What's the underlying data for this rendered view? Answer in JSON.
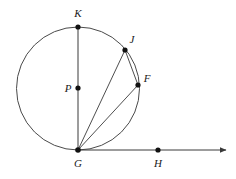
{
  "figure": {
    "kind": "circle-geometry-diagram",
    "background_color": "#ffffff",
    "stroke_color": "#3a3a3a",
    "point_color": "#111111",
    "label_color": "#1a1a1a",
    "width": 236,
    "height": 179
  },
  "circle": {
    "name": "circle-P",
    "center_label": "P",
    "center_x": 78,
    "center_y": 88.5,
    "radius": 61.5
  },
  "points": [
    {
      "id": "K",
      "label": "K",
      "x": 78,
      "y": 27,
      "label_x": 78,
      "label_y": 17,
      "on_circle": true,
      "position": "top"
    },
    {
      "id": "J",
      "label": "J",
      "x": 125,
      "y": 50,
      "label_x": 132,
      "label_y": 43,
      "on_circle": true,
      "position": "upper-right"
    },
    {
      "id": "F",
      "label": "F",
      "x": 138,
      "y": 85,
      "label_x": 147,
      "label_y": 82,
      "on_circle": true,
      "position": "right"
    },
    {
      "id": "P",
      "label": "P",
      "x": 78,
      "y": 88,
      "label_x": 68,
      "label_y": 91,
      "on_circle": false,
      "position": "center"
    },
    {
      "id": "G",
      "label": "G",
      "x": 78,
      "y": 150,
      "label_x": 78,
      "label_y": 166,
      "on_circle": true,
      "position": "bottom"
    },
    {
      "id": "H",
      "label": "H",
      "x": 158,
      "y": 150,
      "label_x": 158,
      "label_y": 166,
      "on_circle": false,
      "position": "bottom-right-on-ray"
    }
  ],
  "segments": [
    {
      "id": "KG",
      "name": "diameter-k-g",
      "from": "K",
      "to": "G",
      "x1": 78,
      "y1": 27,
      "x2": 78,
      "y2": 150
    },
    {
      "id": "GJ",
      "name": "chord-g-j",
      "from": "G",
      "to": "J",
      "x1": 78,
      "y1": 150,
      "x2": 125,
      "y2": 50
    },
    {
      "id": "GF",
      "name": "chord-g-f",
      "from": "G",
      "to": "F",
      "x1": 78,
      "y1": 150,
      "x2": 138,
      "y2": 85
    },
    {
      "id": "JF",
      "name": "chord-j-f",
      "from": "J",
      "to": "F",
      "x1": 125,
      "y1": 50,
      "x2": 138,
      "y2": 85
    }
  ],
  "ray": {
    "id": "GH",
    "name": "tangent-ray-g-h",
    "x1": 78,
    "y1": 150,
    "x2": 228,
    "y2": 150,
    "arrow_at_end": true,
    "through_points": [
      "G",
      "H"
    ]
  }
}
